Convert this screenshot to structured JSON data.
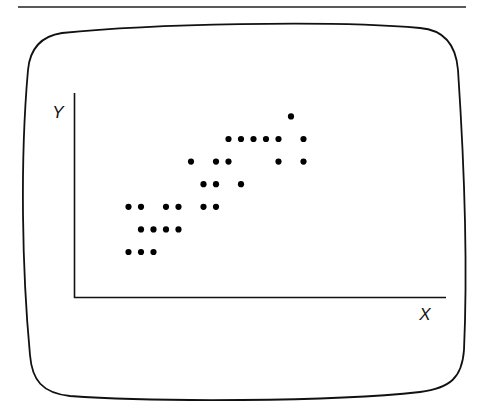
{
  "header": {
    "title": "Scatter Plot",
    "rule_color": "#222222"
  },
  "screen": {
    "outline_color": "#111111"
  },
  "chart_data": {
    "type": "scatter",
    "title": "Scatter Plot",
    "xlabel": "X",
    "ylabel": "Y",
    "grid": false,
    "ticks": false,
    "axis_ranges": {
      "x": [
        0,
        25
      ],
      "y": [
        0,
        9
      ]
    },
    "point_color": "#000000",
    "points": [
      {
        "x": 0,
        "y": 0
      },
      {
        "x": 1,
        "y": 0
      },
      {
        "x": 2,
        "y": 0
      },
      {
        "x": 1,
        "y": 1
      },
      {
        "x": 2,
        "y": 1
      },
      {
        "x": 3,
        "y": 1
      },
      {
        "x": 4,
        "y": 1
      },
      {
        "x": 0,
        "y": 2
      },
      {
        "x": 1,
        "y": 2
      },
      {
        "x": 3,
        "y": 2
      },
      {
        "x": 4,
        "y": 2
      },
      {
        "x": 6,
        "y": 2
      },
      {
        "x": 7,
        "y": 2
      },
      {
        "x": 6,
        "y": 3
      },
      {
        "x": 7,
        "y": 3
      },
      {
        "x": 9,
        "y": 3
      },
      {
        "x": 5,
        "y": 4
      },
      {
        "x": 7,
        "y": 4
      },
      {
        "x": 8,
        "y": 4
      },
      {
        "x": 12,
        "y": 4
      },
      {
        "x": 14,
        "y": 4
      },
      {
        "x": 8,
        "y": 5
      },
      {
        "x": 9,
        "y": 5
      },
      {
        "x": 10,
        "y": 5
      },
      {
        "x": 11,
        "y": 5
      },
      {
        "x": 12,
        "y": 5
      },
      {
        "x": 14,
        "y": 5
      },
      {
        "x": 13,
        "y": 6
      }
    ]
  }
}
